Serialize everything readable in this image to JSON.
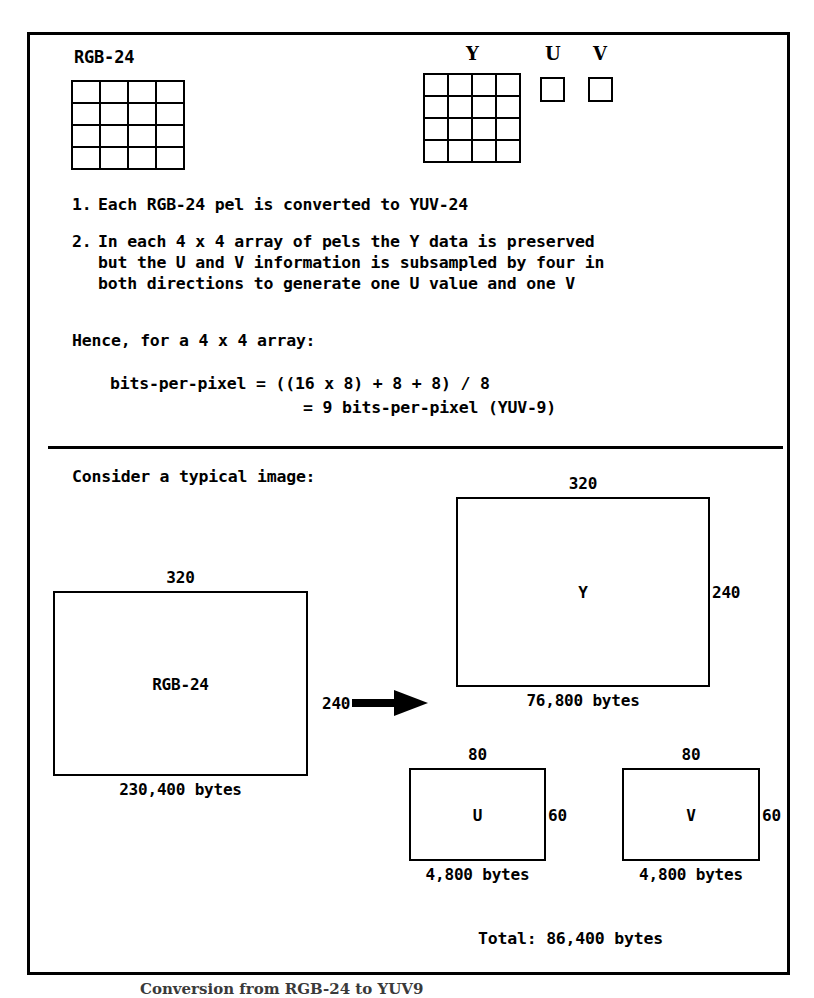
{
  "figure": {
    "caption": "Conversion from RGB-24 to YUV9"
  },
  "top_diagram": {
    "rgb_label": "RGB-24",
    "y_label": "Y",
    "u_label": "U",
    "v_label": "V",
    "rgb_grid": {
      "cols": 4,
      "rows": 4
    },
    "y_grid": {
      "cols": 4,
      "rows": 4
    },
    "u_grid": {
      "cols": 1,
      "rows": 1
    },
    "v_grid": {
      "cols": 1,
      "rows": 1
    }
  },
  "steps": [
    {
      "number": "1.",
      "lines": [
        "Each RGB-24 pel is converted to YUV-24"
      ]
    },
    {
      "number": "2.",
      "lines": [
        "In each 4 x 4 array of pels the Y data is preserved",
        "but the U and V information is subsampled by four in",
        "both directions to generate one U value and one V"
      ]
    }
  ],
  "formula_section": {
    "intro": "Hence, for a 4 x 4 array:",
    "line1": "bits-per-pixel = ((16 x 8) + 8 + 8) / 8",
    "line2": "= 9 bits-per-pixel (YUV-9)"
  },
  "example_section": {
    "heading": "Consider a typical image:",
    "arrow_dim_label": "240",
    "total": "Total: 86,400 bytes",
    "boxes": {
      "rgb_source": {
        "label": "RGB-24",
        "width_label": "320",
        "height_label": "240",
        "bytes": "230,400 bytes"
      },
      "y_plane": {
        "label": "Y",
        "width_label": "320",
        "height_label": "240",
        "bytes": "76,800 bytes"
      },
      "u_plane": {
        "label": "U",
        "width_label": "80",
        "height_label": "60",
        "bytes": "4,800 bytes"
      },
      "v_plane": {
        "label": "V",
        "width_label": "80",
        "height_label": "60",
        "bytes": "4,800 bytes"
      }
    }
  },
  "colors": {
    "ink": "#000000",
    "paper": "#ffffff"
  }
}
